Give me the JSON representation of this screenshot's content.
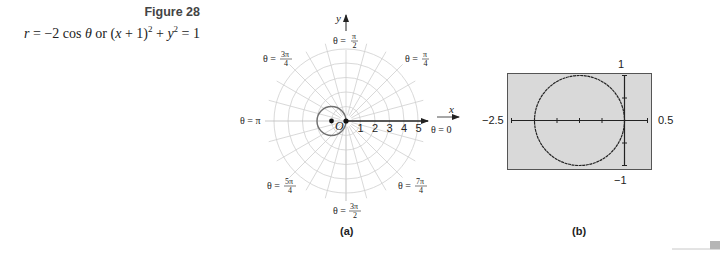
{
  "caption": {
    "figure_label": "Figure 28",
    "equation_parts": {
      "r": "r",
      "eq1": " = −2 cos ",
      "theta": "θ",
      "or": " or (",
      "x": "x",
      "rest1": " + 1)",
      "sup1": "2",
      "plus": " + ",
      "y": "y",
      "sup2": "2",
      "rest2": " = 1"
    }
  },
  "panel_a": {
    "sublabel": "(a)",
    "x_axis_label": "x",
    "y_axis_label": "y",
    "origin_label": "O",
    "radial_ticks": [
      "1",
      "2",
      "3",
      "4",
      "5"
    ],
    "angle_labels": {
      "theta0": "θ = 0",
      "theta_pi4": {
        "prefix": "θ = ",
        "num": "π",
        "den": "4"
      },
      "theta_pi2": {
        "prefix": "θ = ",
        "num": "π",
        "den": "2"
      },
      "theta_3pi4": {
        "prefix": "θ = ",
        "num": "3π",
        "den": "4"
      },
      "theta_pi": "θ = π",
      "theta_5pi4": {
        "prefix": "θ = ",
        "num": "5π",
        "den": "4"
      },
      "theta_3pi2": {
        "prefix": "θ = ",
        "num": "3π",
        "den": "2"
      },
      "theta_7pi4": {
        "prefix": "θ = ",
        "num": "7π",
        "den": "4"
      }
    }
  },
  "panel_b": {
    "sublabel": "(b)",
    "xmin_label": "−2.5",
    "xmax_label": "0.5",
    "ymax_label": "1",
    "ymin_label": "−1"
  },
  "colors": {
    "grid": "#cfcfcf",
    "curve_a": "#707070",
    "axis": "#222222",
    "screen_bg": "#d9d9d9",
    "screen_border": "#555555",
    "corner_mark": "#b5b5b5"
  },
  "chart_data": [
    {
      "type": "scatter",
      "title": "Polar graph of r = −2 cos θ",
      "coordinate_system": "polar",
      "curve": "circle center (−1, 0) radius 1",
      "grid_rings": [
        1,
        2,
        3,
        4,
        5
      ],
      "radial_spacing_deg": 15,
      "marked_points": [
        {
          "x": 0,
          "y": 0
        },
        {
          "x": -1,
          "y": 0
        }
      ],
      "xlabel": "x",
      "ylabel": "y",
      "tick_labels": [
        "1",
        "2",
        "3",
        "4",
        "5"
      ]
    },
    {
      "type": "line",
      "title": "Graphing utility window",
      "curve": "(x + 1)^2 + y^2 = 1",
      "xlim": [
        -2.5,
        0.5
      ],
      "ylim": [
        -1,
        1
      ],
      "x_ticks": [
        -2.5,
        -2,
        -1.5,
        -1,
        -0.5,
        0,
        0.5
      ],
      "y_ticks": [
        -1,
        -0.5,
        0,
        0.5,
        1
      ]
    }
  ]
}
